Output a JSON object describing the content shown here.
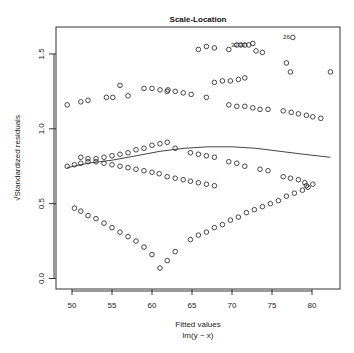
{
  "chart_data": {
    "type": "scatter",
    "title": "Scale-Location",
    "xlabel": "Fitted values",
    "xlabel_sub": "lm(y ~ x)",
    "ylabel": "√Standardized residuals",
    "xlim": [
      48,
      83.5
    ],
    "ylim": [
      -0.07,
      1.68
    ],
    "xticks": [
      50,
      55,
      60,
      65,
      70,
      75,
      80
    ],
    "yticks": [
      0.0,
      0.5,
      1.0,
      1.5
    ],
    "ytick_labels": [
      "0.0",
      "0.5",
      "1.0",
      "1.5"
    ],
    "grid": false,
    "legend": "none",
    "points": [
      [
        65.8,
        1.53
      ],
      [
        66.8,
        1.55
      ],
      [
        67.8,
        1.54
      ],
      [
        69.6,
        1.53
      ],
      [
        70.6,
        1.56
      ],
      [
        71.1,
        1.56
      ],
      [
        71.6,
        1.56
      ],
      [
        72.1,
        1.56
      ],
      [
        72.6,
        1.57
      ],
      [
        73.0,
        1.52
      ],
      [
        73.8,
        1.51
      ],
      [
        76.8,
        1.44
      ],
      [
        77.6,
        1.61
      ],
      [
        49.4,
        1.16
      ],
      [
        51.1,
        1.18
      ],
      [
        52.0,
        1.19
      ],
      [
        54.3,
        1.21
      ],
      [
        55.1,
        1.21
      ],
      [
        56.0,
        1.29
      ],
      [
        57.0,
        1.22
      ],
      [
        59.0,
        1.27
      ],
      [
        60.0,
        1.27
      ],
      [
        61.0,
        1.26
      ],
      [
        61.9,
        1.25
      ],
      [
        62.0,
        1.26
      ],
      [
        62.9,
        1.25
      ],
      [
        63.9,
        1.24
      ],
      [
        64.9,
        1.23
      ],
      [
        66.8,
        1.21
      ],
      [
        67.8,
        1.31
      ],
      [
        68.8,
        1.32
      ],
      [
        69.8,
        1.32
      ],
      [
        70.8,
        1.33
      ],
      [
        71.6,
        1.34
      ],
      [
        77.3,
        1.38
      ],
      [
        82.3,
        1.38
      ],
      [
        69.6,
        1.16
      ],
      [
        70.6,
        1.15
      ],
      [
        71.6,
        1.15
      ],
      [
        72.6,
        1.14
      ],
      [
        73.5,
        1.13
      ],
      [
        74.5,
        1.13
      ],
      [
        76.4,
        1.12
      ],
      [
        77.4,
        1.11
      ],
      [
        78.3,
        1.1
      ],
      [
        79.3,
        1.09
      ],
      [
        80.1,
        1.08
      ],
      [
        81.1,
        1.07
      ],
      [
        51.1,
        0.81
      ],
      [
        52.0,
        0.8
      ],
      [
        53.0,
        0.78
      ],
      [
        54.0,
        0.77
      ],
      [
        55.0,
        0.76
      ],
      [
        56.0,
        0.75
      ],
      [
        57.0,
        0.74
      ],
      [
        58.0,
        0.73
      ],
      [
        59.0,
        0.72
      ],
      [
        60.0,
        0.71
      ],
      [
        60.9,
        0.7
      ],
      [
        61.9,
        0.68
      ],
      [
        62.9,
        0.67
      ],
      [
        63.9,
        0.66
      ],
      [
        64.8,
        0.65
      ],
      [
        65.8,
        0.64
      ],
      [
        66.8,
        0.63
      ],
      [
        67.8,
        0.62
      ],
      [
        49.4,
        0.75
      ],
      [
        50.3,
        0.76
      ],
      [
        51.1,
        0.77
      ],
      [
        52.0,
        0.78
      ],
      [
        53.0,
        0.8
      ],
      [
        54.0,
        0.81
      ],
      [
        55.0,
        0.82
      ],
      [
        56.0,
        0.83
      ],
      [
        57.0,
        0.84
      ],
      [
        58.0,
        0.86
      ],
      [
        59.0,
        0.87
      ],
      [
        60.0,
        0.89
      ],
      [
        61.0,
        0.9
      ],
      [
        61.9,
        0.91
      ],
      [
        62.9,
        0.87
      ],
      [
        64.8,
        0.84
      ],
      [
        65.8,
        0.83
      ],
      [
        66.8,
        0.82
      ],
      [
        67.8,
        0.81
      ],
      [
        69.6,
        0.78
      ],
      [
        70.6,
        0.77
      ],
      [
        71.6,
        0.75
      ],
      [
        73.5,
        0.73
      ],
      [
        74.5,
        0.72
      ],
      [
        76.4,
        0.68
      ],
      [
        77.3,
        0.67
      ],
      [
        78.3,
        0.66
      ],
      [
        79.1,
        0.64
      ],
      [
        79.3,
        0.62
      ],
      [
        80.1,
        0.63
      ],
      [
        50.3,
        0.47
      ],
      [
        51.1,
        0.45
      ],
      [
        52.0,
        0.42
      ],
      [
        53.0,
        0.4
      ],
      [
        54.0,
        0.37
      ],
      [
        55.0,
        0.34
      ],
      [
        56.0,
        0.31
      ],
      [
        57.0,
        0.28
      ],
      [
        58.0,
        0.25
      ],
      [
        59.0,
        0.21
      ],
      [
        60.0,
        0.16
      ],
      [
        61.0,
        0.07
      ],
      [
        61.9,
        0.12
      ],
      [
        62.9,
        0.18
      ],
      [
        64.8,
        0.26
      ],
      [
        65.8,
        0.29
      ],
      [
        66.8,
        0.31
      ],
      [
        67.8,
        0.34
      ],
      [
        68.8,
        0.36
      ],
      [
        69.8,
        0.39
      ],
      [
        70.8,
        0.41
      ],
      [
        71.8,
        0.44
      ],
      [
        72.8,
        0.46
      ],
      [
        73.8,
        0.48
      ],
      [
        74.8,
        0.5
      ],
      [
        75.8,
        0.52
      ],
      [
        76.8,
        0.55
      ],
      [
        77.8,
        0.57
      ],
      [
        78.8,
        0.59
      ],
      [
        79.5,
        0.61
      ]
    ],
    "labeled_points": [
      {
        "label": "32",
        "x": 71.1,
        "y": 1.56
      },
      {
        "label": "37",
        "x": 72.1,
        "y": 1.56
      },
      {
        "label": "26",
        "x": 77.6,
        "y": 1.61
      }
    ],
    "smooth_line": {
      "x": [
        49.4,
        52,
        55,
        58,
        61,
        64,
        67,
        70,
        73,
        76,
        79,
        82.3
      ],
      "y": [
        0.74,
        0.77,
        0.79,
        0.82,
        0.85,
        0.87,
        0.88,
        0.88,
        0.87,
        0.85,
        0.83,
        0.81
      ]
    }
  }
}
